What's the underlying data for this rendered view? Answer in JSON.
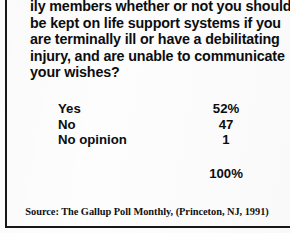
{
  "figure": {
    "kind": "poll-results-table",
    "border_color": "#15171a",
    "background_color": "#fdfdfd",
    "text_color": "#0c0d0f"
  },
  "question": {
    "lines": [
      "ily members whether or not you should",
      "be kept on life support systems if you",
      "are terminally ill or have a debilitating",
      "injury, and are unable to communicate",
      "your wishes?"
    ]
  },
  "results": {
    "rows": [
      {
        "label": "Yes",
        "value": "52%"
      },
      {
        "label": "No",
        "value": "47"
      },
      {
        "label": "No opinion",
        "value": "1"
      }
    ],
    "total": "100%"
  },
  "source": {
    "text": "Source:  The Gallup Poll Monthly, (Princeton, NJ, 1991)"
  },
  "chart_data": {
    "type": "table",
    "title": "ily members whether or not you should be kept on life support systems if you are terminally ill or have a debilitating injury, and are unable to communicate your wishes?",
    "categories": [
      "Yes",
      "No",
      "No opinion"
    ],
    "values": [
      52,
      47,
      1
    ],
    "value_labels": [
      "52%",
      "47",
      "1"
    ],
    "total": 100,
    "total_label": "100%",
    "units": "percent",
    "xlabel": "",
    "ylabel": "",
    "legend": [],
    "grid": false,
    "annotations": [
      "Source:  The Gallup Poll Monthly, (Princeton, NJ, 1991)"
    ]
  }
}
